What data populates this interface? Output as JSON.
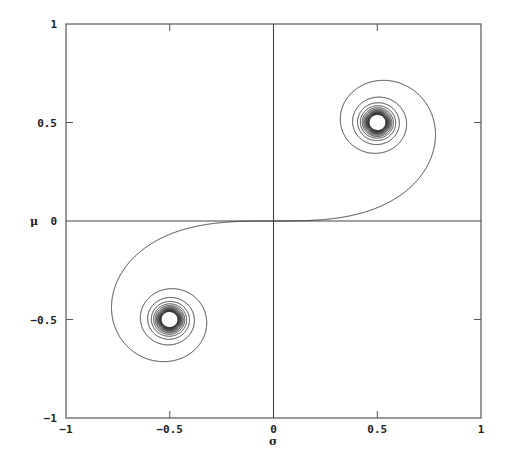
{
  "chart_data": {
    "type": "line",
    "title": "",
    "xlabel": "σ",
    "ylabel": "μ",
    "xlim": [
      -1,
      1
    ],
    "ylim": [
      -1,
      1
    ],
    "grid": false,
    "legend": null,
    "xticks": [
      -1,
      -0.5,
      0,
      0.5,
      1
    ],
    "xtick_labels": [
      "-1",
      "-0.5",
      "0",
      "0.5",
      "1"
    ],
    "yticks": [
      -1,
      -0.5,
      0,
      0.5,
      1
    ],
    "ytick_labels": [
      "-1",
      "-0.5",
      "0",
      "0.5",
      "1"
    ],
    "zero_axes": true,
    "series": [
      {
        "name": "Euler (Cornu) spiral",
        "description": "Clothoid curve through origin spiraling into limit points (0.5, 0.5) and (-0.5, -0.5)",
        "parametric": "x = C(t), y = S(t) (Fresnel integrals)",
        "t_range": [
          -8,
          8
        ],
        "limit_points": [
          [
            0.5,
            0.5
          ],
          [
            -0.5,
            -0.5
          ]
        ],
        "sample_points": [
          {
            "x": 0.0,
            "y": 0.0
          },
          {
            "x": 0.2,
            "y": 0.01
          },
          {
            "x": 0.5,
            "y": 0.07
          },
          {
            "x": 0.7,
            "y": 0.25
          },
          {
            "x": 0.78,
            "y": 0.44
          },
          {
            "x": 0.7,
            "y": 0.64
          },
          {
            "x": 0.47,
            "y": 0.71
          },
          {
            "x": 0.33,
            "y": 0.55
          },
          {
            "x": 0.44,
            "y": 0.36
          },
          {
            "x": 0.5,
            "y": 0.5
          },
          {
            "x": -0.2,
            "y": -0.01
          },
          {
            "x": -0.5,
            "y": -0.07
          },
          {
            "x": -0.7,
            "y": -0.25
          },
          {
            "x": -0.78,
            "y": -0.44
          },
          {
            "x": -0.7,
            "y": -0.64
          },
          {
            "x": -0.47,
            "y": -0.71
          },
          {
            "x": -0.33,
            "y": -0.55
          },
          {
            "x": -0.44,
            "y": -0.36
          },
          {
            "x": -0.5,
            "y": -0.5
          }
        ],
        "color": "#333333"
      }
    ]
  },
  "labels": {
    "x_axis_title": "σ",
    "y_axis_title": "μ"
  },
  "colors": {
    "frame": "#555555",
    "curve": "#333333",
    "background": "#ffffff"
  }
}
